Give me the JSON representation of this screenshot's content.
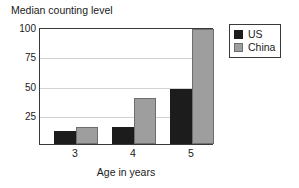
{
  "chart_data": {
    "type": "bar",
    "title": "Median counting level",
    "xlabel": "Age in years",
    "ylabel": "Median counting level",
    "categories": [
      "3",
      "4",
      "5"
    ],
    "series": [
      {
        "name": "US",
        "color": "#1c1c1c",
        "values": [
          11,
          15,
          48
        ]
      },
      {
        "name": "China",
        "color": "#9e9e9e",
        "values": [
          15,
          40,
          100
        ]
      }
    ],
    "ylim": [
      0,
      100
    ],
    "yticks": [
      100,
      75,
      50,
      25
    ],
    "grid": true,
    "legend_position": "right-top"
  },
  "legend": {
    "items": [
      {
        "label": "US",
        "swatch": "black-swatch"
      },
      {
        "label": "China",
        "swatch": "gray-swatch"
      }
    ]
  }
}
